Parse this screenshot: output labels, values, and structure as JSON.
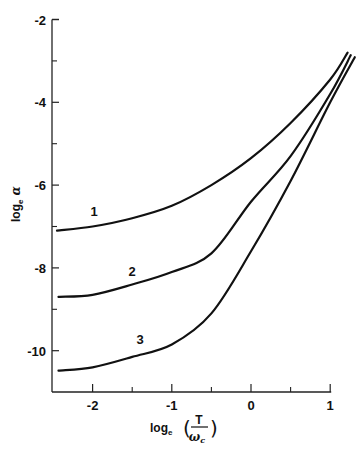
{
  "chart_data": {
    "type": "line",
    "title": "",
    "xlabel": "log_e (T / ω_c)",
    "ylabel": "log_e α",
    "xlabel_parts": {
      "prefix": "log",
      "sub": "e",
      "num": "T",
      "den": "ω",
      "den_sub": "c"
    },
    "ylabel_parts": {
      "prefix": "log",
      "sub": "e",
      "symbol": "α"
    },
    "xlim": [
      -2.5,
      1.3
    ],
    "ylim": [
      -11,
      -2
    ],
    "x_ticks_major": [
      -2,
      -1,
      0,
      1
    ],
    "x_tick_labels": [
      "-2",
      "-1",
      "0",
      "1"
    ],
    "x_ticks_minor": [
      -1.5,
      -0.5,
      0.5
    ],
    "y_ticks_major": [
      -2,
      -4,
      -6,
      -8,
      -10
    ],
    "y_tick_labels": [
      "-2",
      "-4",
      "-6",
      "-8",
      "-10"
    ],
    "y_ticks_minor": [
      -3,
      -5,
      -7,
      -9
    ],
    "grid": false,
    "legend": "inline curve labels",
    "series": [
      {
        "name": "1",
        "label_pos": [
          -1.98,
          -6.75
        ],
        "x": [
          -2.45,
          -2.0,
          -1.5,
          -1.0,
          -0.5,
          0.0,
          0.5,
          1.0,
          1.22
        ],
        "y": [
          -7.1,
          -7.0,
          -6.8,
          -6.5,
          -6.0,
          -5.35,
          -4.5,
          -3.45,
          -2.8
        ]
      },
      {
        "name": "2",
        "label_pos": [
          -1.5,
          -8.2
        ],
        "x": [
          -2.43,
          -2.0,
          -1.5,
          -1.0,
          -0.5,
          0.0,
          0.5,
          1.0,
          1.26
        ],
        "y": [
          -8.7,
          -8.65,
          -8.4,
          -8.1,
          -7.65,
          -6.4,
          -5.3,
          -3.8,
          -2.86
        ]
      },
      {
        "name": "3",
        "label_pos": [
          -1.4,
          -9.85
        ],
        "x": [
          -2.43,
          -2.0,
          -1.5,
          -1.0,
          -0.5,
          0.0,
          0.5,
          1.0,
          1.31
        ],
        "y": [
          -10.48,
          -10.4,
          -10.15,
          -9.85,
          -9.1,
          -7.6,
          -5.9,
          -4.0,
          -2.91
        ]
      }
    ]
  }
}
